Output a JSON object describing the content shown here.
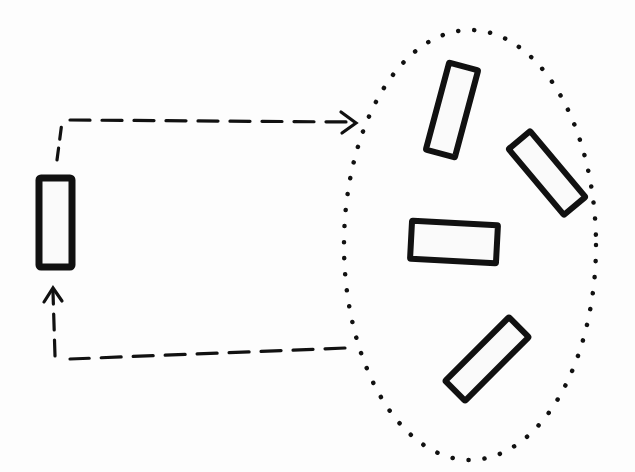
{
  "diagram": {
    "type": "hand-drawn flow diagram",
    "background": "#fdfdfd",
    "stroke_color": "#111111",
    "source_item": {
      "label": "",
      "shape": "rectangle",
      "orientation": "vertical"
    },
    "outbound_arrow": {
      "style": "dashed",
      "direction": "from source item to group"
    },
    "return_arrow": {
      "style": "dashed",
      "direction": "from group back to source item"
    },
    "group": {
      "shape": "dotted ellipse",
      "item_count": 4,
      "items": [
        {
          "shape": "rectangle",
          "orientation": "tilted vertical"
        },
        {
          "shape": "rectangle",
          "orientation": "diagonal"
        },
        {
          "shape": "rectangle",
          "orientation": "horizontal"
        },
        {
          "shape": "rectangle",
          "orientation": "diagonal"
        }
      ]
    }
  }
}
